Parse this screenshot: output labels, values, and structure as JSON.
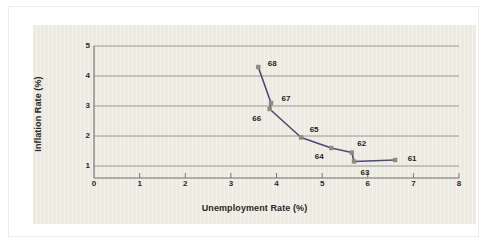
{
  "chart_data": {
    "type": "line",
    "title": "",
    "subtitle": "",
    "xlabel": "Unemployment Rate (%)",
    "ylabel": "Inflation Rate (%)",
    "xlim": [
      0,
      8
    ],
    "ylim": [
      0,
      5
    ],
    "x_ticks": [
      0,
      1,
      2,
      3,
      4,
      5,
      6,
      7,
      8
    ],
    "x_tick_labels": [
      "0",
      "1",
      "2",
      "3",
      "4",
      "5",
      "6",
      "7",
      "8"
    ],
    "y_ticks": [
      1,
      2,
      3,
      4,
      5
    ],
    "y_tick_labels": [
      "1",
      "2",
      "3",
      "4",
      "5"
    ],
    "grid": "horizontal",
    "legend": "none",
    "series": [
      {
        "name": "Phillips curve",
        "line_color": "#4b4a78",
        "marker_color": "#8d8c7c",
        "points": [
          {
            "label": "68",
            "x": 3.6,
            "y": 4.3,
            "label_dx": 14,
            "label_dy": -3
          },
          {
            "label": "67",
            "x": 3.88,
            "y": 3.1,
            "label_dx": 15,
            "label_dy": -4
          },
          {
            "label": "66",
            "x": 3.85,
            "y": 2.9,
            "label_dx": -13,
            "label_dy": 10
          },
          {
            "label": "65",
            "x": 4.54,
            "y": 1.95,
            "label_dx": 13,
            "label_dy": -8
          },
          {
            "label": "64",
            "x": 5.2,
            "y": 1.6,
            "label_dx": -12,
            "label_dy": 9
          },
          {
            "label": "62",
            "x": 5.65,
            "y": 1.45,
            "label_dx": 10,
            "label_dy": -9
          },
          {
            "label": "63",
            "x": 5.7,
            "y": 1.15,
            "label_dx": 11,
            "label_dy": 11
          },
          {
            "label": "61",
            "x": 6.6,
            "y": 1.2,
            "label_dx": 17,
            "label_dy": -1
          }
        ]
      }
    ]
  },
  "style": {
    "panel_background": "#eceae1",
    "page_background": "#ffffff",
    "axis_color": "#6e6e6e",
    "grid_color": "#8f8f8f",
    "text_color": "#2a2a2a"
  }
}
